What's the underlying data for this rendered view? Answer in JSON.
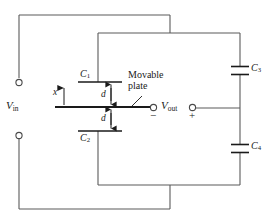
{
  "figure": {
    "type": "circuit-diagram",
    "background_color": "#ffffff",
    "wire_color": "#5a5a5a",
    "plate_color": "#1a1a1a",
    "text_color": "#1a1a1a"
  },
  "labels": {
    "c1": "C",
    "c1_sub": "1",
    "c2": "C",
    "c2_sub": "2",
    "c3": "C",
    "c3_sub": "3",
    "c4": "C",
    "c4_sub": "4",
    "vin": "V",
    "vin_sub": "in",
    "vout": "V",
    "vout_sub": "out",
    "gap_top": "d",
    "gap_bottom": "d",
    "displacement": "x",
    "movable_plate_line1": "Movable",
    "movable_plate_line2": "plate",
    "minus_sign": "−",
    "plus_sign": "+"
  },
  "components": [
    {
      "name": "C1",
      "label": "C₁",
      "kind": "capacitor-plate",
      "role": "upper fixed plate of differential capacitor"
    },
    {
      "name": "C2",
      "label": "C₂",
      "kind": "capacitor-plate",
      "role": "lower fixed plate of differential capacitor"
    },
    {
      "name": "C3",
      "label": "C₃",
      "kind": "capacitor",
      "role": "upper bridge capacitor"
    },
    {
      "name": "C4",
      "label": "C₄",
      "kind": "capacitor",
      "role": "lower bridge capacitor"
    },
    {
      "name": "movable-plate",
      "label": "Movable plate",
      "kind": "plate",
      "role": "center electrode, output node"
    }
  ],
  "dimensions": [
    {
      "name": "gap-top",
      "label": "d",
      "between": "C1 plate and movable plate"
    },
    {
      "name": "gap-bottom",
      "label": "d",
      "between": "movable plate and C2 plate"
    },
    {
      "name": "displacement",
      "label": "x",
      "direction": "up",
      "origin": "movable plate"
    }
  ],
  "ports": [
    {
      "name": "vin-positive-terminal",
      "label": "V_in",
      "position": "left-top"
    },
    {
      "name": "vin-negative-terminal",
      "label": "V_in",
      "position": "left-bottom"
    },
    {
      "name": "vout-negative-terminal",
      "label": "V_out",
      "sign": "−",
      "position": "center-right"
    },
    {
      "name": "vout-positive-terminal",
      "label": "V_out",
      "sign": "+",
      "position": "right"
    }
  ]
}
